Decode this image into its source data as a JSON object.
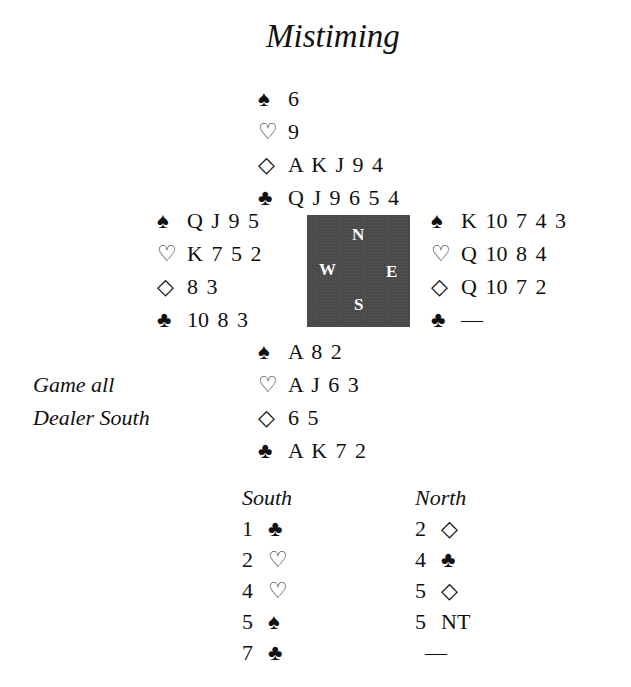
{
  "title": "Mistiming",
  "compass": {
    "north": "N",
    "south": "S",
    "east": "E",
    "west": "W"
  },
  "suits": {
    "spade": "♠",
    "heart": "♡",
    "diamond": "◇",
    "club": "♣"
  },
  "hands": {
    "north": {
      "spades": "6",
      "hearts": "9",
      "diamonds": "A K J 9 4",
      "clubs": "Q J 9 6 5 4"
    },
    "west": {
      "spades": "Q J 9 5",
      "hearts": "K 7 5 2",
      "diamonds": "8 3",
      "clubs": "10 8 3"
    },
    "east": {
      "spades": "K 10 7 4 3",
      "hearts": "Q 10 8 4",
      "diamonds": "Q 10 7 2",
      "clubs": "—"
    },
    "south": {
      "spades": "A 8 2",
      "hearts": "A J 6 3",
      "diamonds": "6 5",
      "clubs": "A K 7 2"
    }
  },
  "info": {
    "vulnerability": "Game all",
    "dealer": "Dealer South"
  },
  "auction": {
    "south_header": "South",
    "north_header": "North",
    "south": [
      {
        "level": "1",
        "suit": "♣"
      },
      {
        "level": "2",
        "suit": "♡"
      },
      {
        "level": "4",
        "suit": "♡"
      },
      {
        "level": "5",
        "suit": "♠"
      },
      {
        "level": "7",
        "suit": "♣"
      }
    ],
    "north": [
      {
        "level": "2",
        "suit": "◇"
      },
      {
        "level": "4",
        "suit": "♣"
      },
      {
        "level": "5",
        "suit": "◇"
      },
      {
        "level": "5",
        "suit": "NT"
      },
      {
        "level": "",
        "suit": "—"
      }
    ]
  }
}
